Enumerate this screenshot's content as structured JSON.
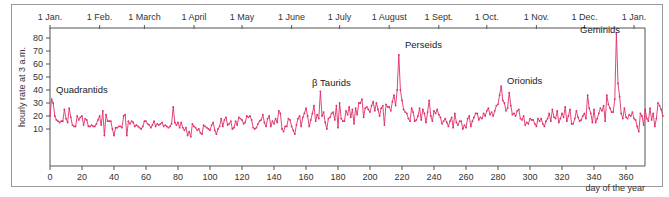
{
  "chart_data": {
    "type": "line",
    "title": "",
    "xlabel": "day of the year",
    "ylabel": "hourly rate at 3 a.m.",
    "xlim": [
      0,
      372
    ],
    "ylim": [
      0,
      85
    ],
    "grid": false,
    "x_ticks": [
      0,
      20,
      40,
      60,
      80,
      100,
      120,
      140,
      160,
      180,
      200,
      220,
      240,
      260,
      280,
      300,
      320,
      340,
      360
    ],
    "y_ticks": [
      10,
      20,
      30,
      40,
      50,
      60,
      70,
      80
    ],
    "month_ticks": [
      {
        "label": "1 Jan.",
        "day": 0
      },
      {
        "label": "1 Feb.",
        "day": 31
      },
      {
        "label": "1 March",
        "day": 59
      },
      {
        "label": "1 April",
        "day": 90
      },
      {
        "label": "1 May",
        "day": 120
      },
      {
        "label": "1 June",
        "day": 151
      },
      {
        "label": "1 July",
        "day": 181
      },
      {
        "label": "1 August",
        "day": 212
      },
      {
        "label": "1 Sept.",
        "day": 243
      },
      {
        "label": "1 Oct.",
        "day": 273
      },
      {
        "label": "1 Nov.",
        "day": 304
      },
      {
        "label": "1 Dec.",
        "day": 334
      },
      {
        "label": "1 Jan.",
        "day": 365
      }
    ],
    "annotations": [
      {
        "label": "Quadrantids",
        "day": 3,
        "value": 38
      },
      {
        "label": "β Taurids",
        "day": 167,
        "value": 43
      },
      {
        "label": "Perseids",
        "day": 220,
        "value": 70
      },
      {
        "label": "Orionids",
        "day": 292,
        "value": 45
      },
      {
        "label": "Geminids",
        "day": 336,
        "value": 84
      }
    ],
    "series": [
      {
        "name": "hourly rate",
        "color": "#e0306a",
        "x_start": 0,
        "x_step": 1,
        "values": [
          20,
          33,
          30,
          20,
          17,
          16,
          15,
          16,
          16,
          25,
          18,
          15,
          26,
          19,
          13,
          12,
          12,
          20,
          17,
          19,
          20,
          13,
          18,
          17,
          12,
          12,
          13,
          12,
          12,
          14,
          17,
          20,
          13,
          24,
          5,
          21,
          16,
          16,
          16,
          10,
          5,
          11,
          11,
          12,
          12,
          11,
          20,
          21,
          5,
          16,
          14,
          16,
          15,
          12,
          13,
          12,
          11,
          10,
          12,
          16,
          16,
          14,
          13,
          11,
          13,
          16,
          12,
          14,
          13,
          14,
          15,
          12,
          13,
          12,
          11,
          12,
          14,
          27,
          15,
          13,
          15,
          11,
          15,
          11,
          9,
          11,
          5,
          8,
          4,
          14,
          12,
          11,
          9,
          10,
          7,
          6,
          13,
          12,
          11,
          10,
          9,
          13,
          15,
          9,
          6,
          10,
          12,
          18,
          12,
          17,
          19,
          13,
          14,
          16,
          10,
          11,
          16,
          13,
          19,
          18,
          17,
          14,
          15,
          20,
          19,
          20,
          17,
          11,
          10,
          11,
          14,
          16,
          17,
          21,
          15,
          12,
          18,
          20,
          12,
          16,
          14,
          18,
          15,
          24,
          22,
          10,
          8,
          12,
          12,
          18,
          17,
          12,
          9,
          6,
          13,
          18,
          20,
          12,
          19,
          22,
          26,
          20,
          12,
          17,
          22,
          28,
          16,
          21,
          18,
          39,
          20,
          23,
          15,
          10,
          18,
          19,
          22,
          23,
          17,
          28,
          11,
          30,
          18,
          16,
          16,
          24,
          21,
          27,
          19,
          25,
          14,
          26,
          21,
          30,
          30,
          33,
          19,
          26,
          27,
          25,
          23,
          28,
          31,
          24,
          30,
          25,
          20,
          26,
          28,
          13,
          29,
          27,
          27,
          24,
          31,
          36,
          28,
          40,
          67,
          40,
          32,
          25,
          23,
          22,
          18,
          16,
          26,
          23,
          16,
          17,
          20,
          26,
          17,
          25,
          22,
          15,
          23,
          32,
          20,
          16,
          24,
          22,
          25,
          21,
          19,
          14,
          16,
          18,
          15,
          12,
          16,
          19,
          11,
          22,
          15,
          13,
          16,
          16,
          10,
          13,
          11,
          18,
          20,
          12,
          16,
          19,
          22,
          22,
          17,
          19,
          18,
          22,
          20,
          24,
          26,
          21,
          23,
          20,
          24,
          28,
          29,
          36,
          43,
          32,
          30,
          24,
          26,
          38,
          28,
          21,
          22,
          20,
          24,
          25,
          18,
          17,
          20,
          13,
          15,
          14,
          18,
          17,
          17,
          14,
          12,
          18,
          16,
          18,
          14,
          12,
          16,
          18,
          22,
          16,
          25,
          19,
          18,
          24,
          15,
          18,
          22,
          19,
          27,
          16,
          20,
          25,
          14,
          14,
          18,
          24,
          19,
          16,
          17,
          20,
          22,
          18,
          36,
          26,
          22,
          15,
          25,
          15,
          18,
          22,
          26,
          24,
          28,
          16,
          36,
          29,
          26,
          23,
          23,
          33,
          84,
          45,
          35,
          22,
          18,
          26,
          19,
          18,
          21,
          20,
          23,
          18,
          17,
          12,
          8,
          22,
          20,
          13,
          25,
          18,
          16,
          26,
          17,
          22,
          12,
          18,
          30,
          28,
          25,
          20
        ]
      }
    ]
  }
}
